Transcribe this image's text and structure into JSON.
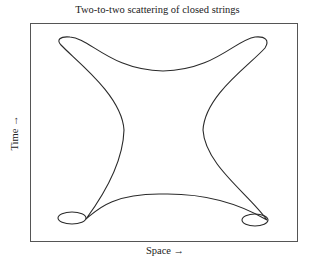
{
  "figure": {
    "title": "Two-to-two scattering of closed strings",
    "xlabel": "Space →",
    "ylabel": "Time →"
  },
  "colors": {
    "stroke": "#2a2a2a",
    "frame": "#555555",
    "background": "#ffffff"
  }
}
